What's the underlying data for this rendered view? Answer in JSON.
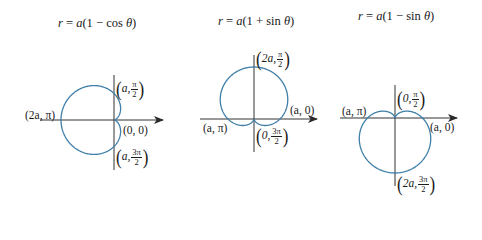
{
  "graphs": [
    {
      "title": {
        "lhs": "r",
        "eq": " = ",
        "a": "a",
        "body": "(1 − cos ",
        "theta": "θ",
        "close": ")"
      },
      "equation": "r = a(1 − cos θ)",
      "labels": [
        {
          "id": "top",
          "pre": "a, ",
          "num": "π",
          "den": "2"
        },
        {
          "id": "left",
          "text": "(2a, π)"
        },
        {
          "id": "origin",
          "text": "(0, 0)"
        },
        {
          "id": "bottom",
          "pre": "a, ",
          "num": "3π",
          "den": "2"
        }
      ]
    },
    {
      "title": {
        "lhs": "r",
        "eq": " = ",
        "a": "a",
        "body": "(1 + sin ",
        "theta": "θ",
        "close": ")"
      },
      "equation": "r = a(1 + sin θ)",
      "labels": [
        {
          "id": "top",
          "pre": "2a, ",
          "num": "π",
          "den": "2"
        },
        {
          "id": "right",
          "text": "(a, 0)"
        },
        {
          "id": "left",
          "text": "(a, π)"
        },
        {
          "id": "bottom",
          "pre": "0, ",
          "num": "3π",
          "den": "2"
        }
      ]
    },
    {
      "title": {
        "lhs": "r",
        "eq": " = ",
        "a": "a",
        "body": "(1 − sin ",
        "theta": "θ",
        "close": ")"
      },
      "equation": "r = a(1 − sin θ)",
      "labels": [
        {
          "id": "top",
          "pre": "0, ",
          "num": "π",
          "den": "2"
        },
        {
          "id": "left",
          "text": "(a, π)"
        },
        {
          "id": "right",
          "text": "(a, 0)"
        },
        {
          "id": "bottom",
          "pre": "2a, ",
          "num": "3π",
          "den": "2"
        }
      ]
    }
  ],
  "colors": {
    "curve": "#3f7fa8",
    "axis": "#333333",
    "text": "#1a1a1a"
  },
  "chart_data": [
    {
      "type": "polar-curve",
      "title": "r = a(1 − cos θ)",
      "kind": "cos",
      "sign": -1,
      "origin": [
        114,
        120
      ],
      "a": 26.5,
      "axes": {
        "h": [
          40,
          163
        ],
        "v": [
          75,
          170
        ]
      },
      "points": [
        "(a, π/2)",
        "(2a, π)",
        "(0, 0)",
        "(a, 3π/2)"
      ]
    },
    {
      "type": "polar-curve",
      "title": "r = a(1 + sin θ)",
      "kind": "sin",
      "sign": 1,
      "origin": [
        254,
        119
      ],
      "a": 26,
      "axes": {
        "h": [
          200,
          317
        ],
        "v": [
          55,
          152
        ]
      },
      "points": [
        "(2a, π/2)",
        "(a, 0)",
        "(a, π)",
        "(0, 3π/2)"
      ]
    },
    {
      "type": "polar-curve",
      "title": "r = a(1 − sin θ)",
      "kind": "sin",
      "sign": -1,
      "origin": [
        395,
        118
      ],
      "a": 27.5,
      "axes": {
        "h": [
          340,
          457
        ],
        "v": [
          85,
          186
        ]
      },
      "points": [
        "(0, π/2)",
        "(a, π)",
        "(a, 0)",
        "(2a, 3π/2)"
      ]
    }
  ]
}
